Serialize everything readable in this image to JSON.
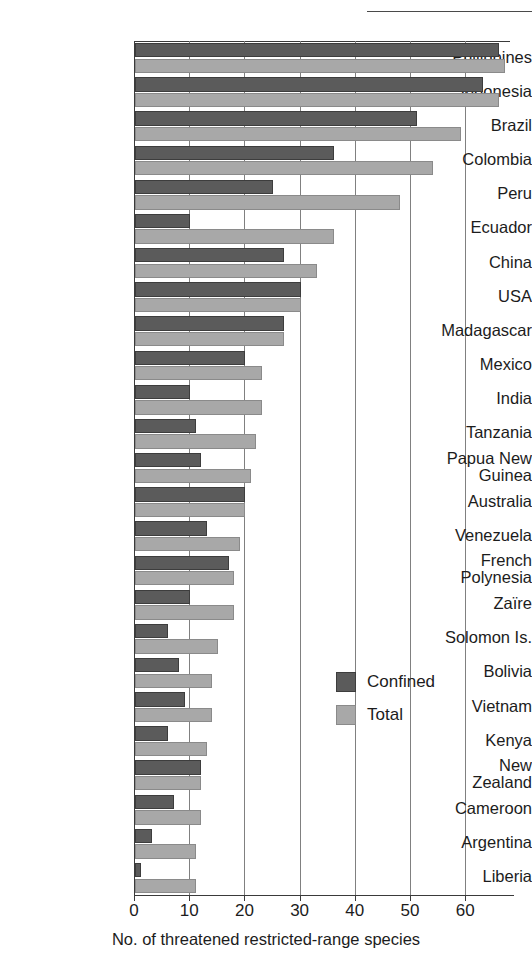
{
  "figure": {
    "background": "#ffffff",
    "confined_color": "#5b5b5b",
    "total_color": "#a8a8a8"
  },
  "chart_data": {
    "type": "bar",
    "orientation": "horizontal",
    "title": "",
    "xlabel": "No. of threatened restricted-range species",
    "ylabel": "",
    "xlim": [
      0,
      68
    ],
    "ticks": [
      0,
      10,
      20,
      30,
      40,
      50,
      60
    ],
    "tick_labels": [
      "0",
      "10",
      "20",
      "30",
      "40",
      "50",
      "60"
    ],
    "grid": "vertical",
    "legend_position": "inside-right-lower",
    "categories": [
      "Philippines",
      "Indonesia",
      "Brazil",
      "Colombia",
      "Peru",
      "Ecuador",
      "China",
      "USA",
      "Madagascar",
      "Mexico",
      "India",
      "Tanzania",
      "Papua New\nGuinea",
      "Australia",
      "Venezuela",
      "French\nPolynesia",
      "Zaïre",
      "Solomon Is.",
      "Bolivia",
      "Vietnam",
      "Kenya",
      "New\nZealand",
      "Cameroon",
      "Argentina",
      "Liberia"
    ],
    "series": [
      {
        "name": "Confined",
        "color": "#5b5b5b",
        "values": [
          66,
          63,
          51,
          36,
          25,
          10,
          27,
          30,
          27,
          20,
          10,
          11,
          12,
          20,
          13,
          17,
          10,
          6,
          8,
          9,
          6,
          12,
          7,
          3,
          1
        ]
      },
      {
        "name": "Total",
        "color": "#a8a8a8",
        "values": [
          67,
          66,
          59,
          54,
          48,
          36,
          33,
          30,
          27,
          23,
          23,
          22,
          21,
          20,
          19,
          18,
          18,
          15,
          14,
          14,
          13,
          12,
          12,
          11,
          11
        ]
      }
    ]
  },
  "legend": {
    "items": [
      {
        "label": "Confined",
        "color": "#5b5b5b"
      },
      {
        "label": "Total",
        "color": "#a8a8a8"
      }
    ]
  }
}
